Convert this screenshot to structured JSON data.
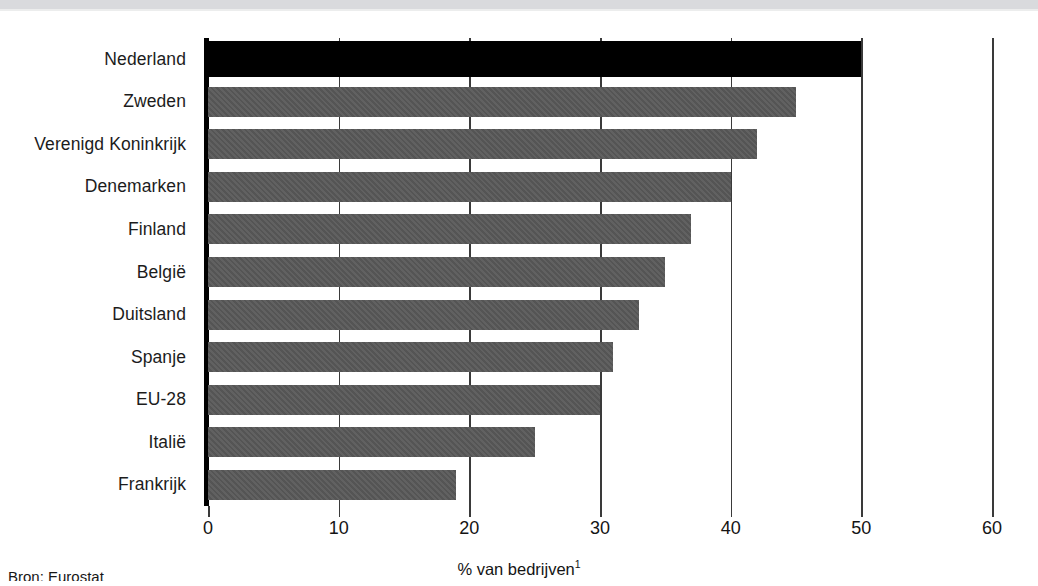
{
  "chart_data": {
    "type": "bar",
    "orientation": "horizontal",
    "title": "",
    "xlabel": "% van bedrijven",
    "xlabel_superscript": "1",
    "ylabel": "",
    "xlim": [
      0,
      60
    ],
    "xticks": [
      0,
      10,
      20,
      30,
      40,
      50,
      60
    ],
    "xtick_labels": [
      "0",
      "10",
      "20",
      "30",
      "40",
      "50",
      "60"
    ],
    "grid": "vertical",
    "legend": "none",
    "categories": [
      "Nederland",
      "Zweden",
      "Verenigd Koninkrijk",
      "Denemarken",
      "Finland",
      "België",
      "Duitsland",
      "Spanje",
      "EU-28",
      "Italië",
      "Frankrijk"
    ],
    "values": [
      50,
      45,
      42,
      40,
      37,
      35,
      33,
      31,
      30,
      25,
      19
    ],
    "highlight_category": "Nederland",
    "colors": {
      "bar": "#595959",
      "highlight_bar": "#000000",
      "grid": "#3a3a3a",
      "axis": "#000000",
      "text": "#1a1a1a",
      "background": "#ffffff"
    }
  },
  "footer": {
    "source": "Bron: Eurostat"
  }
}
